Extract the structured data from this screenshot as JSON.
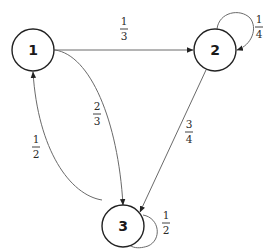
{
  "diagram": {
    "type": "markov-chain-state-diagram",
    "nodes": [
      {
        "id": "1",
        "label": "1"
      },
      {
        "id": "2",
        "label": "2"
      },
      {
        "id": "3",
        "label": "3"
      }
    ],
    "edges": [
      {
        "from": "1",
        "to": "2",
        "num": "1",
        "den": "3"
      },
      {
        "from": "2",
        "to": "2",
        "num": "1",
        "den": "4"
      },
      {
        "from": "1",
        "to": "3",
        "num": "2",
        "den": "3"
      },
      {
        "from": "2",
        "to": "3",
        "num": "3",
        "den": "4"
      },
      {
        "from": "3",
        "to": "1",
        "num": "1",
        "den": "2"
      },
      {
        "from": "3",
        "to": "3",
        "num": "1",
        "den": "2"
      }
    ]
  }
}
